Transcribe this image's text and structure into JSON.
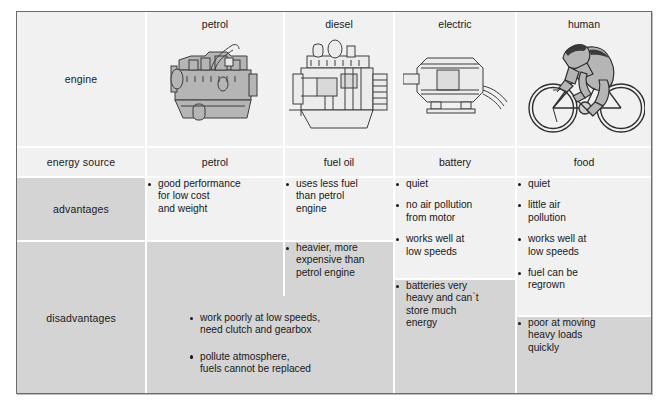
{
  "table": {
    "row_headers": [
      "engine",
      "energy source",
      "advantages",
      "disadvantages"
    ],
    "columns": [
      {
        "name": "petrol",
        "icon": "petrol-engine-illustration",
        "energy_source": "petrol",
        "advantages": [
          "good performance\nfor low cost\nand weight"
        ],
        "disadvantages": []
      },
      {
        "name": "diesel",
        "icon": "diesel-engine-illustration",
        "energy_source": "fuel oil",
        "advantages": [
          "uses less fuel\nthan petrol\nengine"
        ],
        "disadvantages": [
          "heavier, more\nexpensive than\npetrol engine"
        ]
      },
      {
        "name": "electric",
        "icon": "electric-motor-illustration",
        "energy_source": "battery",
        "advantages": [
          "quiet",
          "no air pollution\nfrom motor",
          "works well at\nlow speeds"
        ],
        "disadvantages": [
          "batteries very\nheavy and can`t\nstore much\nenergy"
        ]
      },
      {
        "name": "human",
        "icon": "cyclist-illustration",
        "energy_source": "food",
        "advantages": [
          "quiet",
          "little air\npollution",
          "works well at\nlow speeds",
          "fuel can be\nregrown"
        ],
        "disadvantages": [
          "poor at moving\nheavy loads\nquickly"
        ]
      }
    ],
    "shared_disadvantages_petrol_diesel": [
      "work poorly at low speeds,\nneed clutch and gearbox",
      "pollute atmosphere,\nfuels cannot be replaced"
    ]
  },
  "colors": {
    "light_cell": "#f1f1f1",
    "dark_cell": "#d4d4d4",
    "border": "#6b6b6b",
    "text": "#17191a",
    "artwork_fill": "#b3b3b3",
    "artwork_line": "#3a3a3a"
  }
}
